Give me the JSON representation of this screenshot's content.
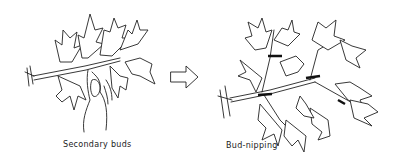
{
  "diagram": {
    "panels": [
      {
        "id": "before",
        "caption": "Secondary buds",
        "depicts": "branch with leaves, hand holding secondary bud"
      },
      {
        "id": "after",
        "caption": "Bud-nipping",
        "depicts": "branch with multiple shoots, nipped points marked"
      }
    ],
    "arrow": {
      "direction": "right",
      "style": "outlined",
      "meaning": "transition"
    },
    "colors": {
      "line": "#222222",
      "background": "#ffffff"
    }
  }
}
